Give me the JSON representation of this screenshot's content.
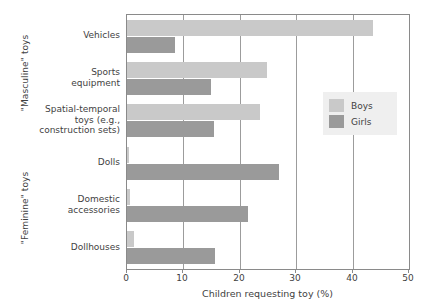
{
  "chart_data": {
    "type": "bar",
    "orientation": "horizontal",
    "title": "",
    "xlabel": "Children requesting toy (%)",
    "ylabel": "",
    "xlim": [
      0,
      50
    ],
    "xticks": [
      0,
      10,
      20,
      30,
      40,
      50
    ],
    "xticklabels": [
      "0",
      "10",
      "20",
      "30",
      "40",
      "50"
    ],
    "grid": true,
    "grid_axis": "x",
    "legend_position": "center-right",
    "categories": [
      "Vehicles",
      "Sports equipment",
      "Spatial-temporal toys (e.g., construction sets)",
      "Dolls",
      "Domestic accessories",
      "Dollhouses"
    ],
    "category_label_lines": [
      [
        "Vehicles"
      ],
      [
        "Sports",
        "equipment"
      ],
      [
        "Spatial-temporal",
        "toys (e.g.,",
        "construction sets)"
      ],
      [
        "Dolls"
      ],
      [
        "Domestic",
        "accessories"
      ],
      [
        "Dollhouses"
      ]
    ],
    "group_labels": [
      {
        "text": "\"Masculine\" toys",
        "categories": [
          "Vehicles",
          "Sports equipment",
          "Spatial-temporal toys (e.g., construction sets)"
        ]
      },
      {
        "text": "\"Feminine\" toys",
        "categories": [
          "Dolls",
          "Domestic accessories",
          "Dollhouses"
        ]
      }
    ],
    "series": [
      {
        "name": "Boys",
        "color": "#c9c9c9",
        "values": [
          43.6,
          24.8,
          23.6,
          0.3,
          0.6,
          1.2
        ]
      },
      {
        "name": "Girls",
        "color": "#9a9a9a",
        "values": [
          8.5,
          14.9,
          15.4,
          27.0,
          21.5,
          15.6
        ]
      }
    ]
  },
  "legend": {
    "entries": [
      {
        "label": "Boys",
        "color": "#c9c9c9"
      },
      {
        "label": "Girls",
        "color": "#9a9a9a"
      }
    ]
  },
  "colors": {
    "boys": "#c9c9c9",
    "girls": "#9a9a9a",
    "axis": "#8a8a8a",
    "grid": "#9c9c9c",
    "text": "#3f3f3f",
    "legend_background": "#efefef",
    "background": "#ffffff"
  }
}
